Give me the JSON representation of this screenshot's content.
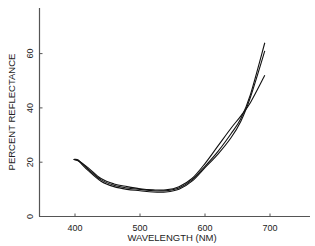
{
  "chart_data": {
    "type": "line",
    "title": "",
    "xlabel": "WAVELENGTH (NM)",
    "ylabel": "PERCENT REFLECTANCE",
    "xlim": [
      345,
      762
    ],
    "ylim": [
      0,
      76
    ],
    "xticks": [
      400,
      500,
      600,
      700
    ],
    "yticks": [
      0,
      20,
      40,
      60
    ],
    "grid": false,
    "legend": null,
    "series": [
      {
        "name": "curve-1",
        "x": [
          398,
          405,
          420,
          440,
          460,
          480,
          500,
          520,
          540,
          560,
          580,
          600,
          620,
          640,
          655,
          670,
          692
        ],
        "y": [
          21,
          20.8,
          17.5,
          13.5,
          11.5,
          10.5,
          10,
          9.5,
          9.5,
          10.5,
          13.5,
          18.5,
          24,
          30.5,
          36,
          45,
          64
        ]
      },
      {
        "name": "curve-2",
        "x": [
          398,
          405,
          420,
          440,
          460,
          480,
          500,
          520,
          540,
          560,
          580,
          600,
          620,
          640,
          655,
          670,
          692
        ],
        "y": [
          21,
          20.5,
          17,
          13,
          11,
          10,
          9.5,
          9,
          9,
          10,
          13,
          18,
          23,
          29,
          35,
          44,
          61
        ]
      },
      {
        "name": "curve-3",
        "x": [
          398,
          405,
          420,
          440,
          460,
          480,
          500,
          520,
          540,
          560,
          580,
          600,
          620,
          640,
          655,
          670,
          692
        ],
        "y": [
          21,
          20.5,
          18,
          14,
          12,
          11,
          10.2,
          9.8,
          9.8,
          11,
          14,
          19.5,
          26,
          32.5,
          37,
          42,
          52
        ]
      }
    ]
  },
  "labels": {
    "xlabel": "WAVELENGTH (NM)",
    "ylabel": "PERCENT REFLECTANCE",
    "xticks": [
      "400",
      "500",
      "600",
      "700"
    ],
    "yticks": [
      "0",
      "20",
      "40",
      "60"
    ]
  }
}
